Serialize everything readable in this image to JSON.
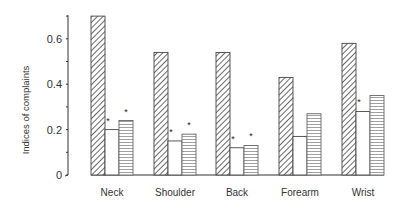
{
  "chart_data": {
    "type": "bar",
    "title": "",
    "xlabel": "",
    "ylabel": "Indices of complaints",
    "ylim": [
      0,
      0.7
    ],
    "yticks": [
      0,
      0.2,
      0.4,
      0.6
    ],
    "ytick_labels": [
      "0",
      "0.2",
      "0.4",
      "0.6"
    ],
    "grid": false,
    "legend": null,
    "categories": [
      "Neck",
      "Shoulder",
      "Back",
      "Forearm",
      "Wrist"
    ],
    "series": [
      {
        "name": "Series 1 (diagonal hatch)",
        "pattern": "diagonal-hatch",
        "values": [
          0.7,
          0.54,
          0.54,
          0.43,
          0.58
        ]
      },
      {
        "name": "Series 2 (open)",
        "pattern": "open",
        "values": [
          0.2,
          0.15,
          0.12,
          0.17,
          0.28
        ]
      },
      {
        "name": "Series 3 (horizontal lines)",
        "pattern": "horizontal-lines",
        "values": [
          0.24,
          0.18,
          0.13,
          0.27,
          0.35
        ]
      }
    ],
    "annotations": [
      {
        "category": "Neck",
        "series": 2,
        "text": "*"
      },
      {
        "category": "Neck",
        "series": 3,
        "text": "*"
      },
      {
        "category": "Shoulder",
        "series": 2,
        "text": "*"
      },
      {
        "category": "Shoulder",
        "series": 3,
        "text": "*"
      },
      {
        "category": "Back",
        "series": 2,
        "text": "*"
      },
      {
        "category": "Back",
        "series": 3,
        "text": "*"
      },
      {
        "category": "Wrist",
        "series": 2,
        "text": "*"
      }
    ]
  },
  "colors": {
    "ink": "#333333",
    "background": "#ffffff"
  }
}
